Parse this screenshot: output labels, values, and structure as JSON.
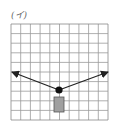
{
  "figure": {
    "label": "(イ)",
    "grid": {
      "cols": 10,
      "rows": 10,
      "x0": 11,
      "y0": 24,
      "width": 97,
      "height": 96,
      "line_color": "#9a9a9a",
      "border_color": "#888888"
    },
    "pivot": {
      "cx": 59,
      "cy": 90,
      "r": 3.6,
      "color": "#111111"
    },
    "block": {
      "x": 54,
      "y": 97,
      "width": 10,
      "height": 15,
      "fill": "#a0a0a0",
      "stroke": "#555555"
    },
    "arrows": [
      {
        "name": "left",
        "from": [
          59,
          90
        ],
        "to": [
          12,
          72
        ]
      },
      {
        "name": "right",
        "from": [
          59,
          90
        ],
        "to": [
          108,
          72
        ]
      }
    ],
    "arrow_color": "#222222"
  }
}
